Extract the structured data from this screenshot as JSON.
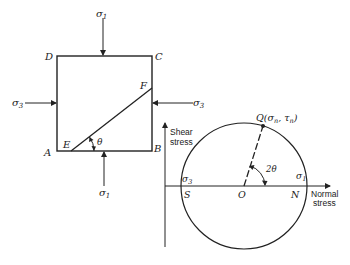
{
  "element": {
    "corners": {
      "A": "A",
      "B": "B",
      "C": "C",
      "D": "D"
    },
    "plane_points": {
      "E": "E",
      "F": "F"
    },
    "angle_label": "θ",
    "stress_top": "σ",
    "stress_top_sub": "1",
    "stress_bottom": "σ",
    "stress_bottom_sub": "1",
    "stress_left": "σ",
    "stress_left_sub": "3",
    "stress_right": "σ",
    "stress_right_sub": "3"
  },
  "mohr": {
    "y_axis_label_line1": "Shear",
    "y_axis_label_line2": "stress",
    "x_axis_label_line1": "Normal",
    "x_axis_label_line2": "stress",
    "center": "O",
    "left_point": "S",
    "right_point": "N",
    "sigma3": "σ",
    "sigma3_sub": "3",
    "sigma1": "σ",
    "sigma1_sub": "1",
    "point_q": "Q(σ",
    "point_q_sub_n": "n",
    "point_q_mid": ", τ",
    "point_q_sub_n2": "n",
    "point_q_end": ")",
    "angle_label": "2θ"
  },
  "colors": {
    "ink": "#222222",
    "background": "#ffffff"
  }
}
